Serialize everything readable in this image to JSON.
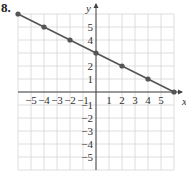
{
  "figure_label": "8.",
  "colors": {
    "line": "#555555",
    "grid": "#d6d6d6",
    "axis": "#444444",
    "point": "#555555"
  },
  "chart_data": {
    "type": "line",
    "title": "",
    "xlabel": "x",
    "ylabel": "y",
    "xlim": [
      -6,
      6
    ],
    "ylim": [
      -6,
      6
    ],
    "grid": true,
    "x_ticks": [
      -5,
      -4,
      -3,
      -2,
      -1,
      1,
      2,
      3,
      4,
      5
    ],
    "y_ticks": [
      5,
      4,
      2,
      1,
      -1,
      -2,
      -3,
      -4,
      -5
    ],
    "series": [
      {
        "name": "line",
        "x": [
          -6,
          -4,
          -2,
          0,
          2,
          4,
          6
        ],
        "y": [
          6,
          5,
          4,
          3,
          2,
          1,
          0
        ]
      }
    ],
    "equation_implied": "y = -x/2 + 3"
  }
}
